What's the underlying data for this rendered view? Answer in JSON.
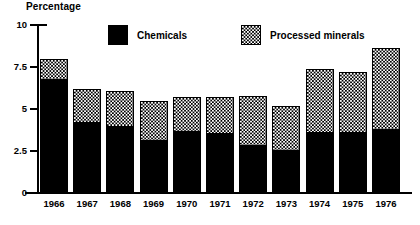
{
  "chart_data": {
    "type": "bar",
    "subtype": "stacked-vertical",
    "title": "",
    "xlabel": "",
    "ylabel": "Percentage",
    "ylim": [
      0,
      10
    ],
    "ytick_labels": [
      "10",
      "7.5",
      "5",
      "2.5",
      "0"
    ],
    "ytick_values": [
      10,
      7.5,
      5,
      2.5,
      0
    ],
    "grid": false,
    "legend_position": "top-center",
    "categories": [
      "1966",
      "1967",
      "1968",
      "1969",
      "1970",
      "1971",
      "1972",
      "1973",
      "1974",
      "1975",
      "1976"
    ],
    "series": [
      {
        "name": "Chemicals",
        "fill": "solid-black",
        "color": "#000000",
        "values": [
          6.7,
          4.15,
          3.9,
          3.1,
          3.65,
          3.5,
          2.8,
          2.5,
          3.6,
          3.6,
          3.75
        ]
      },
      {
        "name": "Processed minerals",
        "fill": "dotted-stipple",
        "color": "#ffffff",
        "values": [
          1.3,
          2.05,
          2.2,
          2.4,
          2.05,
          2.2,
          3.0,
          2.7,
          3.8,
          3.6,
          4.9
        ]
      }
    ],
    "totals": [
      8.0,
      6.2,
      6.1,
      5.5,
      5.7,
      5.7,
      5.8,
      5.2,
      7.4,
      7.2,
      8.65
    ]
  },
  "legend": {
    "items": [
      {
        "label": "Chemicals",
        "swatch": "solid-black-square-icon"
      },
      {
        "label": "Processed minerals",
        "swatch": "dotted-square-icon"
      }
    ]
  },
  "axis": {
    "y_title": "Percentage"
  }
}
